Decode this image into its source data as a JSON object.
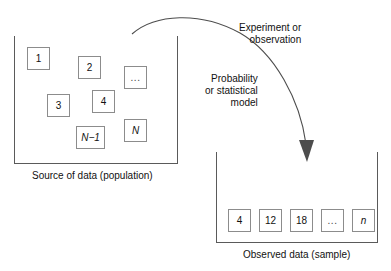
{
  "diagram": {
    "population": {
      "caption": "Source of data (population)",
      "units": [
        {
          "label": "1",
          "x": 27,
          "y": 47,
          "style": "plain"
        },
        {
          "label": "2",
          "x": 78,
          "y": 56,
          "style": "plain"
        },
        {
          "label": "...",
          "x": 124,
          "y": 66,
          "style": "dots"
        },
        {
          "label": "3",
          "x": 47,
          "y": 94,
          "style": "plain"
        },
        {
          "label": "4",
          "x": 92,
          "y": 90,
          "style": "plain"
        },
        {
          "label": "N−1",
          "x": 76,
          "y": 126,
          "style": "italic-wide"
        },
        {
          "label": "N",
          "x": 124,
          "y": 119,
          "style": "italic"
        }
      ]
    },
    "sample": {
      "caption": "Observed  data (sample)",
      "units": [
        {
          "label": "4",
          "x": 228,
          "y": 209,
          "style": "plain"
        },
        {
          "label": "12",
          "x": 259,
          "y": 209,
          "style": "plain"
        },
        {
          "label": "18",
          "x": 290,
          "y": 209,
          "style": "plain"
        },
        {
          "label": "...",
          "x": 321,
          "y": 209,
          "style": "dots"
        },
        {
          "label": "n",
          "x": 352,
          "y": 209,
          "style": "italic"
        }
      ]
    },
    "annotations": [
      {
        "name": "experiment-label",
        "lines": [
          "Experiment or",
          "observation"
        ]
      },
      {
        "name": "model-label",
        "lines": [
          "Probability",
          "or statistical",
          "model"
        ]
      }
    ],
    "arrow": {
      "name": "sampling-arrow",
      "direction": "population-to-sample",
      "color": "#4d4d4d"
    }
  },
  "colors": {
    "stroke": "#5a5a5a",
    "unit_stroke": "#8c8c8c",
    "text": "#111111",
    "arrow": "#4d4d4d",
    "background": "#ffffff"
  }
}
